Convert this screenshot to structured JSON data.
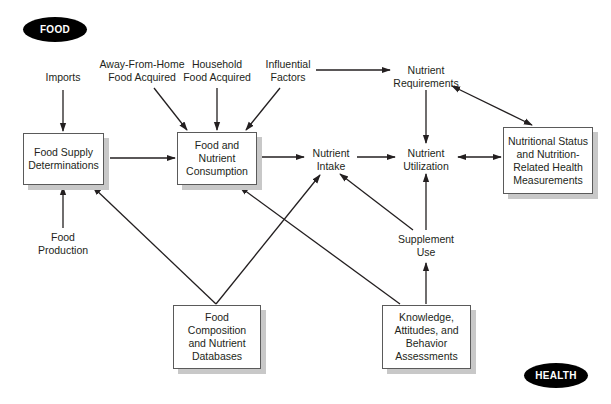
{
  "diagram": {
    "badges": {
      "food": "FOOD",
      "health": "HEALTH"
    },
    "nodes": {
      "imports": "Imports",
      "away_from_home": "Away-From-Home\nFood Acquired",
      "household": "Household\nFood Acquired",
      "influential": "Influential\nFactors",
      "nutrient_requirements": "Nutrient\nRequirements",
      "food_supply": "Food Supply\nDeterminations",
      "food_nutrient_consumption": "Food and\nNutrient\nConsumption",
      "nutrient_intake": "Nutrient\nIntake",
      "nutrient_utilization": "Nutrient\nUtilization",
      "nutritional_status": "Nutritional Status\nand Nutrition-\nRelated Health\nMeasurements",
      "food_production": "Food\nProduction",
      "supplement_use": "Supplement\nUse",
      "food_composition": "Food\nComposition\nand Nutrient\nDatabases",
      "knowledge": "Knowledge,\nAttitudes, and\nBehavior\nAssessments"
    },
    "edges": [
      {
        "from": "Imports",
        "to": "Food Supply Determinations"
      },
      {
        "from": "Food Production",
        "to": "Food Supply Determinations"
      },
      {
        "from": "Food Supply Determinations",
        "to": "Food and Nutrient Consumption"
      },
      {
        "from": "Away-From-Home Food Acquired",
        "to": "Food and Nutrient Consumption"
      },
      {
        "from": "Household Food Acquired",
        "to": "Food and Nutrient Consumption"
      },
      {
        "from": "Influential Factors",
        "to": "Food and Nutrient Consumption"
      },
      {
        "from": "Influential Factors",
        "to": "Nutrient Requirements"
      },
      {
        "from": "Food and Nutrient Consumption",
        "to": "Nutrient Intake"
      },
      {
        "from": "Nutrient Intake",
        "to": "Nutrient Utilization"
      },
      {
        "from": "Nutrient Requirements",
        "to": "Nutrient Utilization"
      },
      {
        "from": "Nutrient Requirements",
        "to": "Nutritional Status and Nutrition-Related Health Measurements",
        "bidirectional": true
      },
      {
        "from": "Nutrient Utilization",
        "to": "Nutritional Status and Nutrition-Related Health Measurements",
        "bidirectional": true
      },
      {
        "from": "Supplement Use",
        "to": "Nutrient Utilization"
      },
      {
        "from": "Supplement Use",
        "to": "Nutrient Intake"
      },
      {
        "from": "Knowledge, Attitudes, and Behavior Assessments",
        "to": "Supplement Use"
      },
      {
        "from": "Knowledge, Attitudes, and Behavior Assessments",
        "to": "Food and Nutrient Consumption"
      },
      {
        "from": "Food Composition and Nutrient Databases",
        "to": "Food Supply Determinations"
      },
      {
        "from": "Food Composition and Nutrient Databases",
        "to": "Nutrient Intake"
      }
    ]
  }
}
